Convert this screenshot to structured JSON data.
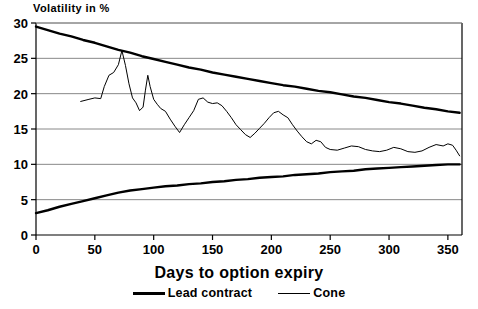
{
  "chart_data": {
    "type": "line",
    "title": "",
    "ylabel": "Volatility in %",
    "xlabel": "Days to option expiry",
    "xlim": [
      0,
      362
    ],
    "ylim": [
      0,
      30
    ],
    "xticks": [
      0,
      50,
      100,
      150,
      200,
      250,
      300,
      350
    ],
    "yticks": [
      0,
      5,
      10,
      15,
      20,
      25,
      30
    ],
    "grid": "horizontal",
    "legend_position": "below",
    "series": [
      {
        "name": "Lead contract",
        "style": "thick",
        "color": "#000000",
        "comment": "upper cone boundary, decaying from 29.5 to 17.3",
        "points": [
          [
            0,
            29.5
          ],
          [
            10,
            29.0
          ],
          [
            20,
            28.5
          ],
          [
            30,
            28.1
          ],
          [
            40,
            27.6
          ],
          [
            50,
            27.2
          ],
          [
            60,
            26.7
          ],
          [
            70,
            26.2
          ],
          [
            80,
            25.8
          ],
          [
            90,
            25.3
          ],
          [
            100,
            24.9
          ],
          [
            110,
            24.5
          ],
          [
            120,
            24.1
          ],
          [
            130,
            23.7
          ],
          [
            140,
            23.4
          ],
          [
            150,
            23.0
          ],
          [
            160,
            22.7
          ],
          [
            170,
            22.4
          ],
          [
            180,
            22.1
          ],
          [
            190,
            21.8
          ],
          [
            200,
            21.5
          ],
          [
            210,
            21.2
          ],
          [
            220,
            21.0
          ],
          [
            230,
            20.7
          ],
          [
            240,
            20.4
          ],
          [
            250,
            20.2
          ],
          [
            260,
            19.9
          ],
          [
            270,
            19.6
          ],
          [
            280,
            19.4
          ],
          [
            290,
            19.1
          ],
          [
            300,
            18.8
          ],
          [
            310,
            18.6
          ],
          [
            320,
            18.3
          ],
          [
            330,
            18.0
          ],
          [
            340,
            17.8
          ],
          [
            350,
            17.5
          ],
          [
            360,
            17.3
          ]
        ]
      },
      {
        "name": "Lead contract lower",
        "style": "thick",
        "color": "#000000",
        "comment": "lower cone boundary, rising from 3.1 to 10.0",
        "points": [
          [
            0,
            3.1
          ],
          [
            10,
            3.5
          ],
          [
            20,
            4.0
          ],
          [
            30,
            4.4
          ],
          [
            40,
            4.8
          ],
          [
            50,
            5.2
          ],
          [
            60,
            5.6
          ],
          [
            70,
            6.0
          ],
          [
            80,
            6.3
          ],
          [
            90,
            6.5
          ],
          [
            100,
            6.7
          ],
          [
            110,
            6.9
          ],
          [
            120,
            7.0
          ],
          [
            130,
            7.2
          ],
          [
            140,
            7.3
          ],
          [
            150,
            7.5
          ],
          [
            160,
            7.6
          ],
          [
            170,
            7.8
          ],
          [
            180,
            7.9
          ],
          [
            190,
            8.1
          ],
          [
            200,
            8.2
          ],
          [
            210,
            8.3
          ],
          [
            220,
            8.5
          ],
          [
            230,
            8.6
          ],
          [
            240,
            8.7
          ],
          [
            250,
            8.9
          ],
          [
            260,
            9.0
          ],
          [
            270,
            9.1
          ],
          [
            280,
            9.3
          ],
          [
            290,
            9.4
          ],
          [
            300,
            9.5
          ],
          [
            310,
            9.6
          ],
          [
            320,
            9.7
          ],
          [
            330,
            9.8
          ],
          [
            340,
            9.9
          ],
          [
            350,
            10.0
          ],
          [
            360,
            10.0
          ]
        ]
      },
      {
        "name": "Cone",
        "style": "thin",
        "color": "#000000",
        "comment": "observed jagged volatility series, starts day 38",
        "points": [
          [
            38,
            18.9
          ],
          [
            45,
            19.2
          ],
          [
            50,
            19.4
          ],
          [
            55,
            19.3
          ],
          [
            58,
            21.0
          ],
          [
            62,
            22.6
          ],
          [
            66,
            23.0
          ],
          [
            70,
            24.1
          ],
          [
            73,
            26.1
          ],
          [
            76,
            24.0
          ],
          [
            79,
            21.4
          ],
          [
            82,
            19.4
          ],
          [
            85,
            18.7
          ],
          [
            88,
            17.6
          ],
          [
            91,
            18.1
          ],
          [
            93,
            20.5
          ],
          [
            95,
            22.6
          ],
          [
            97,
            21.0
          ],
          [
            100,
            19.2
          ],
          [
            103,
            18.5
          ],
          [
            106,
            17.9
          ],
          [
            110,
            17.5
          ],
          [
            114,
            16.4
          ],
          [
            118,
            15.4
          ],
          [
            122,
            14.5
          ],
          [
            126,
            15.6
          ],
          [
            130,
            16.6
          ],
          [
            134,
            17.6
          ],
          [
            138,
            19.2
          ],
          [
            142,
            19.4
          ],
          [
            146,
            18.8
          ],
          [
            150,
            18.6
          ],
          [
            154,
            18.7
          ],
          [
            158,
            18.3
          ],
          [
            162,
            17.5
          ],
          [
            166,
            16.6
          ],
          [
            170,
            15.6
          ],
          [
            174,
            14.9
          ],
          [
            178,
            14.2
          ],
          [
            182,
            13.8
          ],
          [
            186,
            14.4
          ],
          [
            190,
            15.1
          ],
          [
            194,
            15.8
          ],
          [
            198,
            16.6
          ],
          [
            202,
            17.3
          ],
          [
            206,
            17.5
          ],
          [
            210,
            17.0
          ],
          [
            214,
            16.6
          ],
          [
            218,
            15.6
          ],
          [
            222,
            14.7
          ],
          [
            226,
            13.9
          ],
          [
            230,
            13.2
          ],
          [
            234,
            12.9
          ],
          [
            238,
            13.4
          ],
          [
            242,
            13.2
          ],
          [
            246,
            12.4
          ],
          [
            250,
            12.1
          ],
          [
            256,
            12.0
          ],
          [
            262,
            12.3
          ],
          [
            268,
            12.6
          ],
          [
            274,
            12.5
          ],
          [
            280,
            12.1
          ],
          [
            286,
            11.9
          ],
          [
            292,
            11.8
          ],
          [
            298,
            12.0
          ],
          [
            304,
            12.4
          ],
          [
            310,
            12.2
          ],
          [
            316,
            11.8
          ],
          [
            322,
            11.7
          ],
          [
            328,
            11.9
          ],
          [
            334,
            12.4
          ],
          [
            340,
            12.8
          ],
          [
            346,
            12.6
          ],
          [
            350,
            12.9
          ],
          [
            354,
            12.7
          ],
          [
            357,
            12.0
          ],
          [
            360,
            11.2
          ]
        ]
      }
    ]
  },
  "axes": {
    "y_tick_labels": [
      "0",
      "5",
      "10",
      "15",
      "20",
      "25",
      "30"
    ],
    "x_tick_labels": [
      "0",
      "50",
      "100",
      "150",
      "200",
      "250",
      "300",
      "350"
    ],
    "y_axis_title": "Volatility in %",
    "x_axis_title": "Days to option expiry"
  },
  "legend": {
    "items": [
      {
        "label": "Lead contract",
        "style": "thick"
      },
      {
        "label": "Cone",
        "style": "thin"
      }
    ]
  },
  "colors": {
    "line": "#000000",
    "grid": "#888888",
    "axis": "#000000",
    "background": "#ffffff"
  }
}
